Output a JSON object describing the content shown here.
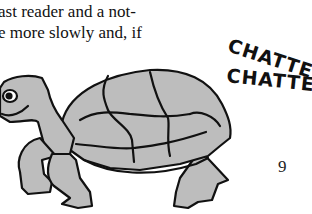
{
  "page": {
    "text_lines": [
      "ast reader and a not-",
      "e more slowly and, if"
    ],
    "page_number": "9"
  },
  "illustration": {
    "subject": "turtle-illustration",
    "sound_effect": [
      "CHATTER",
      "CHATTER"
    ],
    "fill_color": "#bdbdbd",
    "outline_color": "#111111"
  }
}
